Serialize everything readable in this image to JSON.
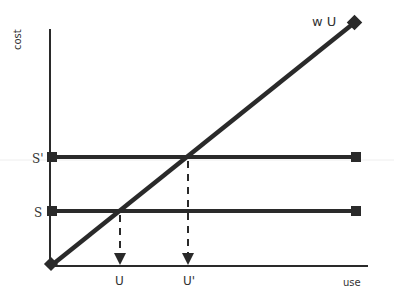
{
  "diagram": {
    "axes": {
      "y_label": "cost",
      "x_label": "use"
    },
    "lines": {
      "diagonal_label": "w U",
      "s_prime_label": "S'",
      "s_label": "S"
    },
    "markers": {
      "u_label": "U",
      "u_prime_label": "U'"
    },
    "colors": {
      "line": "#2a2a2a",
      "text": "#333333",
      "background": "#ffffff"
    }
  }
}
